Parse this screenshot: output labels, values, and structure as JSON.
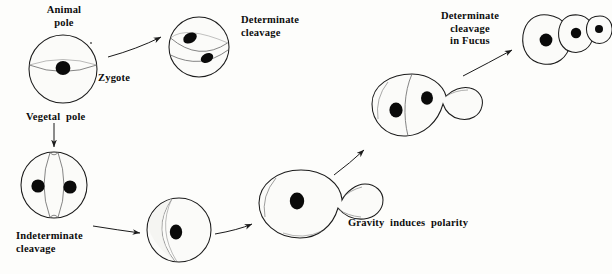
{
  "figure": {
    "domain": "biology-diagram",
    "background_color": "#fdfdfb",
    "ink_color": "#1b1b1b",
    "nucleus_color": "#0a0a0a",
    "shading_color": "#6f6f6f"
  },
  "labels": {
    "animal_pole": "Animal\npole",
    "zygote": "Zygote",
    "vegetal_pole": "Vegetal  pole",
    "determinate_cleavage": "Determinate\ncleavage",
    "indeterminate_cleavage": "Indeterminate\ncleavage",
    "gravity_induces_polarity": "Gravity  induces  polarity",
    "determinate_cleavage_fucus": "Determinate\ncleavage\nin Fucus"
  },
  "stages": [
    {
      "id": "zygote-sphere",
      "name": "Zygote with animal and vegetal poles",
      "type": "sphere",
      "nuclei": 1,
      "division_plane": "equatorial-line",
      "cx": 63,
      "cy": 69,
      "r": 34
    },
    {
      "id": "determinate-two-cell",
      "name": "Determinate cleavage two-cell stage",
      "type": "sphere",
      "nuclei": 2,
      "division_plane": "oblique",
      "cx": 199,
      "cy": 47,
      "r": 30
    },
    {
      "id": "indeterminate-two-cell",
      "name": "Indeterminate cleavage two-cell stage",
      "type": "sphere",
      "nuclei": 2,
      "division_plane": "meridional",
      "cx": 54,
      "cy": 185,
      "r": 33
    },
    {
      "id": "polarized-egg",
      "name": "Polarized egg with crescent",
      "type": "sphere",
      "nuclei": 1,
      "division_plane": "crescent",
      "cx": 179,
      "cy": 230,
      "r": 32
    },
    {
      "id": "rhizoid-zygote",
      "name": "Zygote with rhizoid outgrowth",
      "type": "pear",
      "nuclei": 1,
      "cx": 300,
      "cy": 203
    },
    {
      "id": "two-cell-rhizoid",
      "name": "Two-celled embryo with rhizoid",
      "type": "pear-divided",
      "nuclei": 2,
      "cx": 415,
      "cy": 107
    },
    {
      "id": "fucus-filament",
      "name": "Three-celled Fucus filament",
      "type": "filament",
      "nuclei": 3,
      "cx": 553,
      "cy": 38
    }
  ],
  "arrows": [
    {
      "id": "arrow-zygote-to-determinate",
      "from": "zygote-sphere",
      "to": "determinate-two-cell",
      "direction": "up-right"
    },
    {
      "id": "arrow-vegetal-to-indeterminate",
      "from": "vegetal-pole-label",
      "to": "indeterminate-two-cell",
      "direction": "down"
    },
    {
      "id": "arrow-indeterminate-to-polarized",
      "from": "indeterminate-two-cell",
      "to": "polarized-egg",
      "direction": "right"
    },
    {
      "id": "arrow-polarized-to-rhizoid",
      "from": "polarized-egg",
      "to": "rhizoid-zygote",
      "direction": "up-right"
    },
    {
      "id": "arrow-rhizoid-to-twocell",
      "from": "rhizoid-zygote",
      "to": "two-cell-rhizoid",
      "direction": "up-right"
    },
    {
      "id": "arrow-twocell-to-filament",
      "from": "two-cell-rhizoid",
      "to": "fucus-filament",
      "direction": "up-right"
    }
  ]
}
